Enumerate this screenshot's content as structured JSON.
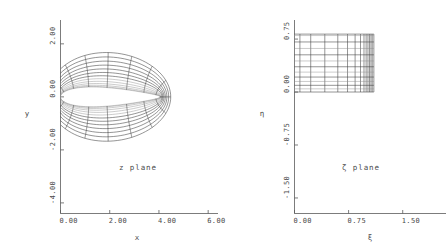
{
  "figure": {
    "background": "#ffffff",
    "ink": "#3c3c3c",
    "axis_color": "#5a5a5a"
  },
  "panels": [
    {
      "id": "z-plane",
      "plane_label": "z plane",
      "xlabel": "x",
      "ylabel": "y",
      "xticks": [
        "0.00",
        "2.00",
        "4.00",
        "6.00"
      ],
      "xtick_values": [
        0,
        2,
        4,
        6
      ],
      "yticks": [
        "2.00",
        "0.00",
        "-2.00",
        "-4.00"
      ],
      "ytick_values": [
        2,
        0,
        -2,
        -4
      ],
      "xlim": [
        0,
        6.4
      ],
      "ylim": [
        -4.4,
        2.9
      ]
    },
    {
      "id": "zeta-plane",
      "plane_label": "ζ plane",
      "xlabel": "ξ",
      "ylabel": "η",
      "xticks": [
        "0.00",
        "0.75",
        "1.50"
      ],
      "xtick_values": [
        0,
        0.75,
        1.5
      ],
      "yticks": [
        "0.75",
        "0.00",
        "-0.75",
        "-1.50"
      ],
      "ytick_values": [
        0.75,
        0,
        -0.75,
        -1.5
      ],
      "xlim": [
        0,
        2.1
      ],
      "ylim": [
        -1.72,
        1.02
      ]
    }
  ],
  "chart_data": {
    "type": "line",
    "title": "",
    "subtitle": "",
    "legend_position": "none",
    "grid": false,
    "panels": [
      {
        "name": "z plane",
        "xlabel": "x",
        "ylabel": "y",
        "xlim": [
          0,
          6.4
        ],
        "ylim": [
          -4.4,
          2.9
        ],
        "xticks": [
          0,
          2,
          4,
          6
        ],
        "yticks": [
          -4,
          -2,
          0,
          2
        ],
        "xtick_labels": [
          "0.00",
          "2.00",
          "4.00",
          "6.00"
        ],
        "ytick_labels": [
          "-4.00",
          "-2.00",
          "0.00",
          "2.00"
        ],
        "annotation": "z plane",
        "annotation_x": 2.55,
        "annotation_y": -2.75,
        "mesh": {
          "kind": "joukowski-ogrid-half",
          "radial_count": 13,
          "azimuthal_count": 17,
          "inner_radius": 0.18,
          "outer_radius": 1.08,
          "trailing_edge_x": 4.1,
          "top_extent_y": 2.25,
          "bottom_extent_y": -2.25,
          "faint_radial_levels": [
            0,
            1,
            2,
            3,
            4,
            5
          ],
          "note": "radial stations clustered near inner body; azimuth spans the half plane x>=0"
        }
      },
      {
        "name": "zeta plane",
        "xlabel": "ξ",
        "ylabel": "η",
        "xlim": [
          0,
          2.1
        ],
        "ylim": [
          -1.72,
          1.02
        ],
        "xticks": [
          0,
          0.75,
          1.5
        ],
        "yticks": [
          -1.5,
          -0.75,
          0,
          0.75
        ],
        "xtick_labels": [
          "0.00",
          "0.75",
          "1.50"
        ],
        "ytick_labels": [
          "-1.50",
          "-0.75",
          "0.00",
          "0.75"
        ],
        "annotation": "ζ plane",
        "annotation_x": 1.07,
        "annotation_y": -1.03,
        "mesh": {
          "kind": "rectangular",
          "xi_min": 0.0,
          "xi_max": 1.1,
          "eta_min": 0.0,
          "eta_max": 0.82,
          "xi_lines": [
            0.0,
            0.075,
            0.225,
            0.42,
            0.6,
            0.735,
            0.84,
            0.915,
            0.963,
            0.993,
            1.018,
            1.04,
            1.06,
            1.078,
            1.1
          ],
          "eta_lines": [
            0.0,
            0.045,
            0.095,
            0.15,
            0.212,
            0.282,
            0.358,
            0.44,
            0.527,
            0.617,
            0.709,
            0.8,
            0.82
          ],
          "note": "xi stations clustered toward right edge; eta stations nearly uniform"
        }
      }
    ]
  }
}
